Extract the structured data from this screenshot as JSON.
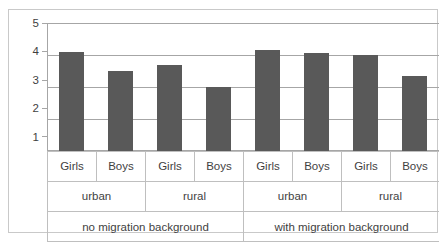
{
  "chart_data": {
    "type": "bar",
    "title": "",
    "subtitle": "",
    "xlabel": "",
    "ylabel": "",
    "ylim": [
      1,
      5
    ],
    "yticks": [
      "1",
      "2",
      "3",
      "4",
      "5"
    ],
    "grid": true,
    "legend": false,
    "legend_position": "none",
    "orientation": "vertical",
    "bar_color": "#595959",
    "gridline_color": "#a6a6a6",
    "categories": [
      "Girls",
      "Boys",
      "Girls",
      "Boys",
      "Girls",
      "Boys",
      "Girls",
      "Boys"
    ],
    "values": [
      4.1,
      3.5,
      3.7,
      3.0,
      4.15,
      4.05,
      4.0,
      3.35
    ],
    "group_levels": {
      "level_1_label": "sex",
      "level_2_label": "area",
      "level_3_label": "migration background"
    },
    "level_2_categories": [
      "urban",
      "rural",
      "urban",
      "rural"
    ],
    "level_3_categories": [
      "no migration background",
      "with migration background"
    ],
    "series": [
      {
        "name": "mean value",
        "points": [
          {
            "migration": "no migration background",
            "area": "urban",
            "sex": "Girls",
            "value": 4.1
          },
          {
            "migration": "no migration background",
            "area": "urban",
            "sex": "Boys",
            "value": 3.5
          },
          {
            "migration": "no migration background",
            "area": "rural",
            "sex": "Girls",
            "value": 3.7
          },
          {
            "migration": "no migration background",
            "area": "rural",
            "sex": "Boys",
            "value": 3.0
          },
          {
            "migration": "with migration background",
            "area": "urban",
            "sex": "Girls",
            "value": 4.15
          },
          {
            "migration": "with migration background",
            "area": "urban",
            "sex": "Boys",
            "value": 4.05
          },
          {
            "migration": "with migration background",
            "area": "rural",
            "sex": "Girls",
            "value": 4.0
          },
          {
            "migration": "with migration background",
            "area": "rural",
            "sex": "Boys",
            "value": 3.35
          }
        ]
      }
    ]
  },
  "axis": {
    "y_ticks": [
      {
        "label": "5",
        "value": 5
      },
      {
        "label": "4",
        "value": 4
      },
      {
        "label": "3",
        "value": 3
      },
      {
        "label": "2",
        "value": 2
      },
      {
        "label": "1",
        "value": 1
      }
    ]
  },
  "cat_rows": {
    "sex": [
      {
        "label": "Girls"
      },
      {
        "label": "Boys"
      },
      {
        "label": "Girls"
      },
      {
        "label": "Boys"
      },
      {
        "label": "Girls"
      },
      {
        "label": "Boys"
      },
      {
        "label": "Girls"
      },
      {
        "label": "Boys"
      }
    ],
    "area": [
      {
        "label": "urban"
      },
      {
        "label": "rural"
      },
      {
        "label": "urban"
      },
      {
        "label": "rural"
      }
    ],
    "migration": [
      {
        "label": "no migration background"
      },
      {
        "label": "with migration background"
      }
    ]
  }
}
